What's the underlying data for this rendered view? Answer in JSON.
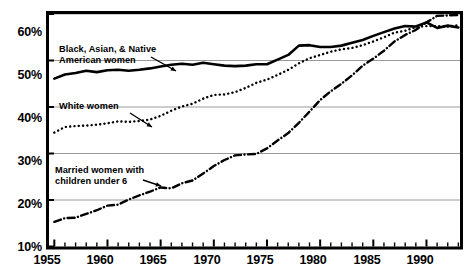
{
  "figure": {
    "title_remnant": "",
    "background": "#ffffff",
    "frame_color": "#000000",
    "grid_color": "#9a9a9a"
  },
  "axes": {
    "y_ticks": [
      "60%",
      "50%",
      "40%",
      "30%",
      "20%",
      "10%"
    ],
    "x_ticks": [
      "1955",
      "1960",
      "1965",
      "1970",
      "1975",
      "1980",
      "1985",
      "1990"
    ]
  },
  "annotations": {
    "black_asian_native": "Black, Asian, & Native\nAmerican women",
    "white": "White women",
    "married_under6": "Married women with\nchildren under 6"
  },
  "chart_data": {
    "type": "line",
    "title": "",
    "xlabel": "",
    "ylabel": "",
    "xlim": [
      1954.5,
      1993.2
    ],
    "ylim": [
      10,
      60
    ],
    "y_tick_values": [
      10,
      20,
      30,
      40,
      50,
      60
    ],
    "y_tick_labels": [
      "10%",
      "20%",
      "30%",
      "40%",
      "50%",
      "60%"
    ],
    "x_tick_values": [
      1955,
      1960,
      1965,
      1970,
      1975,
      1980,
      1985,
      1990
    ],
    "x_tick_labels": [
      "1955",
      "1960",
      "1965",
      "1970",
      "1975",
      "1980",
      "1985",
      "1990"
    ],
    "x_minor_tick_interval": 1,
    "grid": "horizontal",
    "legend": "inline-annotations",
    "series": [
      {
        "name": "Black, Asian, & Native American women",
        "style": "solid",
        "color": "#000000",
        "linewidth": 2.6,
        "x": [
          1955,
          1956,
          1957,
          1958,
          1959,
          1960,
          1961,
          1962,
          1963,
          1964,
          1965,
          1966,
          1967,
          1968,
          1969,
          1970,
          1971,
          1972,
          1973,
          1974,
          1975,
          1976,
          1977,
          1978,
          1979,
          1980,
          1981,
          1982,
          1983,
          1984,
          1985,
          1986,
          1987,
          1988,
          1989,
          1990,
          1991,
          1992,
          1993
        ],
        "values": [
          46.1,
          47.0,
          47.3,
          47.8,
          47.5,
          47.9,
          48.0,
          47.8,
          48.0,
          48.3,
          48.7,
          49.1,
          49.3,
          49.1,
          49.5,
          49.2,
          48.9,
          48.8,
          48.9,
          49.2,
          49.2,
          50.2,
          51.2,
          53.2,
          53.3,
          52.9,
          52.9,
          53.2,
          53.8,
          54.4,
          55.3,
          56.1,
          56.9,
          57.4,
          57.3,
          58.2,
          57.0,
          57.5,
          57.1
        ]
      },
      {
        "name": "White women",
        "style": "dotted",
        "color": "#000000",
        "linewidth": 2.4,
        "x": [
          1955,
          1956,
          1957,
          1958,
          1959,
          1960,
          1961,
          1962,
          1963,
          1964,
          1965,
          1966,
          1967,
          1968,
          1969,
          1970,
          1971,
          1972,
          1973,
          1974,
          1975,
          1976,
          1977,
          1978,
          1979,
          1980,
          1981,
          1982,
          1983,
          1984,
          1985,
          1986,
          1987,
          1988,
          1989,
          1990,
          1991,
          1992,
          1993
        ],
        "values": [
          34.5,
          35.7,
          35.9,
          36.0,
          36.2,
          36.5,
          36.9,
          36.8,
          37.0,
          37.3,
          38.1,
          39.2,
          40.1,
          40.7,
          41.8,
          42.6,
          42.7,
          43.2,
          44.1,
          45.2,
          45.9,
          46.9,
          48.0,
          49.4,
          50.5,
          51.2,
          51.9,
          52.4,
          52.7,
          53.3,
          54.1,
          55.0,
          56.0,
          56.4,
          57.2,
          57.4,
          57.4,
          57.3,
          57.6
        ]
      },
      {
        "name": "Married women with children under 6",
        "style": "dashdot",
        "color": "#000000",
        "linewidth": 2.4,
        "x": [
          1955,
          1956,
          1957,
          1958,
          1959,
          1960,
          1961,
          1962,
          1963,
          1964,
          1965,
          1966,
          1967,
          1968,
          1969,
          1970,
          1971,
          1972,
          1973,
          1974,
          1975,
          1976,
          1977,
          1978,
          1979,
          1980,
          1981,
          1982,
          1983,
          1984,
          1985,
          1986,
          1987,
          1988,
          1989,
          1990,
          1991,
          1992,
          1993
        ],
        "values": [
          15.3,
          16.1,
          16.2,
          17.0,
          17.8,
          18.8,
          19.0,
          20.1,
          21.0,
          21.8,
          22.7,
          22.5,
          23.6,
          24.2,
          25.7,
          27.3,
          28.6,
          29.6,
          29.8,
          29.9,
          31.1,
          32.8,
          34.4,
          36.6,
          39.0,
          41.5,
          43.4,
          45.0,
          46.8,
          48.9,
          50.4,
          52.1,
          54.1,
          55.5,
          56.6,
          58.2,
          59.6,
          59.7,
          59.8
        ]
      }
    ]
  }
}
